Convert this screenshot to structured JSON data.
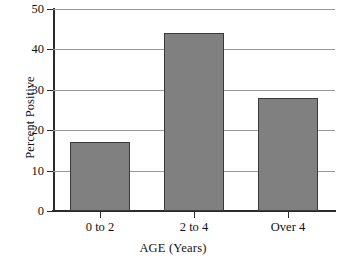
{
  "chart_data": {
    "type": "bar",
    "title": "",
    "categories": [
      "0 to 2",
      "2 to 4",
      "Over 4"
    ],
    "values": [
      17,
      44,
      28
    ],
    "xlabel": "AGE (Years)",
    "ylabel": "Percent Positive",
    "ylim": [
      0,
      50
    ],
    "yticks": [
      0,
      10,
      20,
      30,
      40,
      50
    ],
    "ytick_labels": [
      "0",
      "10",
      "20",
      "30",
      "40",
      "50"
    ],
    "grid": true,
    "legend": false,
    "bar_color": "#808080",
    "bar_edge_color": "#3a3a3a",
    "grid_color": "#9a9a9a",
    "axis_color": "#2b2b2b"
  }
}
